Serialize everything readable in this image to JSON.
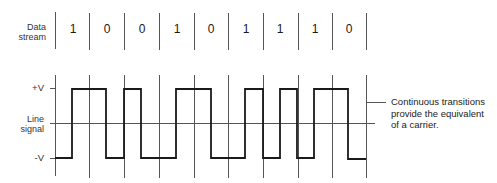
{
  "data_stream": {
    "label_line1": "Data",
    "label_line2": "stream",
    "bits": [
      "1",
      "0",
      "0",
      "1",
      "0",
      "1",
      "1",
      "1",
      "0"
    ]
  },
  "line_signal": {
    "label_line1": "Line",
    "label_line2": "signal",
    "plus_label": "+V",
    "minus_label": "-V"
  },
  "annotation": {
    "line1": "Continuous transitions",
    "line2": "provide the equivalent",
    "line3": "of a carrier."
  },
  "colors": {
    "waveform": "#1a1a1a",
    "grid": "#555555"
  }
}
